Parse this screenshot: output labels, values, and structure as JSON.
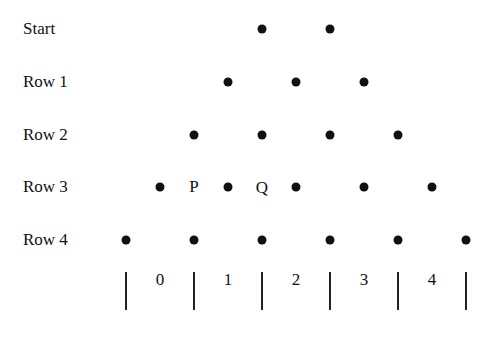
{
  "rows": [
    {
      "label": "Start",
      "y": 29,
      "dots": [
        262,
        330
      ]
    },
    {
      "label": "Row 1",
      "y": 82,
      "dots": [
        228,
        296,
        364
      ]
    },
    {
      "label": "Row 2",
      "y": 135,
      "dots": [
        194,
        262,
        330,
        398
      ]
    },
    {
      "label": "Row 3",
      "y": 187,
      "dots": [
        160,
        228,
        296,
        364,
        432
      ]
    },
    {
      "label": "Row 4",
      "y": 240,
      "dots": [
        126,
        194,
        262,
        330,
        398,
        466
      ]
    }
  ],
  "letters": [
    {
      "text": "P",
      "x": 194,
      "y": 187
    },
    {
      "text": "Q",
      "x": 262,
      "y": 188
    }
  ],
  "bars": {
    "x": [
      126,
      194,
      262,
      330,
      398,
      466
    ],
    "top": 272,
    "bottom": 310
  },
  "bins": [
    {
      "label": "0",
      "x": 160
    },
    {
      "label": "1",
      "x": 228
    },
    {
      "label": "2",
      "x": 296
    },
    {
      "label": "3",
      "x": 364
    },
    {
      "label": "4",
      "x": 432
    }
  ],
  "bin_label_y": 280
}
